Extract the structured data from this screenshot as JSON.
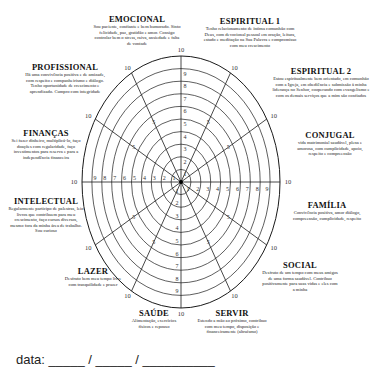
{
  "wheel": {
    "center": [
      181,
      182
    ],
    "radius_x": 99,
    "radius_y": 126,
    "rings": 10,
    "line_color": "#1a1a1a",
    "max_label": "10",
    "scale": [
      "1",
      "2",
      "3",
      "4",
      "5",
      "6",
      "7",
      "8",
      "9",
      "10"
    ]
  },
  "areas": [
    {
      "title": "EMOCIONAL",
      "description": "Sou paciente, confiante e bem humorado. Sinto felicidade, paz, gratidão e amor. Consigo controlar bem o stress, raiva, ansiedade e falta de vontade"
    },
    {
      "title": "ESPIRITUAL 1",
      "description": "Tenho relacionamento de íntima comunhão com Deus, com devocional pessoal em oração, leitura, estudo e meditação na Sua Palavra e compromisso com meu crescimento"
    },
    {
      "title": "ESPIRITUAL 2",
      "description": "Estou espiritualmente bem orientado, em comunhão com a Igreja, em obediência e submissão à minha liderança no Senhor, cooperando com evangelismo e com os demais serviços que a mim são confiados"
    },
    {
      "title": "CONJUGAL",
      "description": "vida matrimonial saudável, plena e amorosa, com cumplicidade, apoio, respeito e compreensão"
    },
    {
      "title": "FAMÍLIA",
      "description": "Convivência positiva, amor diálogo, compreensão, cumplicidade, respeito"
    },
    {
      "title": "SOCIAL",
      "description": "Desfruto de um tempo com meus amigos de uma forma saudável. Contribuo positivamente para suas vidas e eles com a minha"
    },
    {
      "title": "SERVIR",
      "description": "Estendo a mão ao próximo, contribuo com meu tempo, disposição e financeiramente (altruísmo)"
    },
    {
      "title": "SAÚDE",
      "description": "Alimentação, exercícios físicos e repouso"
    },
    {
      "title": "LAZER",
      "description": "Desfruto bem meu tempo livre com tranquilidade e prazer"
    },
    {
      "title": "INTELECTUAL",
      "description": "Regularmente participo de palestras, leio livros que contribuem para meu crescimento, faço cursos diversos, mesmo fora da minha área de trabalho. Sou curioso"
    },
    {
      "title": "FINANÇAS",
      "description": "Sei fazer dinheiro, multiplicá-lo, faço doações com regularidade, faço investimentos para reserva e para a independência financeira"
    },
    {
      "title": "PROFISSIONAL",
      "description": "Há uma convivência positiva e de amizade, com respeito e companheirismo e diálogo. Tenho oportunidade de crescimento e aprendizado. Cumpro com integridade"
    }
  ],
  "footer": {
    "date_label": "data:",
    "date_blanks": "_____ / _____ / __________"
  }
}
